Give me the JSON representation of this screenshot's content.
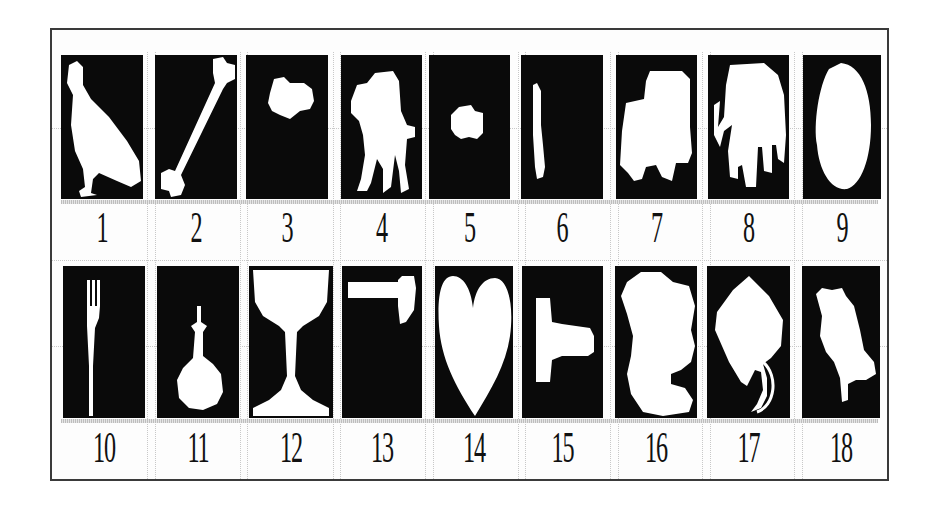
{
  "figure": {
    "rows": [
      {
        "items": [
          {
            "label": "1",
            "shape": "bird-silhouette"
          },
          {
            "label": "2",
            "shape": "bone-silhouette"
          },
          {
            "label": "3",
            "shape": "small-blob-silhouette"
          },
          {
            "label": "4",
            "shape": "camel-silhouette"
          },
          {
            "label": "5",
            "shape": "small-car-silhouette"
          },
          {
            "label": "6",
            "shape": "thin-bar-silhouette"
          },
          {
            "label": "7",
            "shape": "truck-silhouette"
          },
          {
            "label": "8",
            "shape": "elephant-silhouette"
          },
          {
            "label": "9",
            "shape": "oval-silhouette"
          }
        ]
      },
      {
        "items": [
          {
            "label": "10",
            "shape": "fork-silhouette"
          },
          {
            "label": "11",
            "shape": "flask-silhouette"
          },
          {
            "label": "12",
            "shape": "goblet-silhouette"
          },
          {
            "label": "13",
            "shape": "hammer-silhouette"
          },
          {
            "label": "14",
            "shape": "heart-silhouette"
          },
          {
            "label": "15",
            "shape": "key-silhouette"
          },
          {
            "label": "16",
            "shape": "bear-silhouette"
          },
          {
            "label": "17",
            "shape": "kite-silhouette"
          },
          {
            "label": "18",
            "shape": "animal-silhouette"
          }
        ]
      }
    ],
    "colors": {
      "tile_background": "#0a0a0a",
      "shape_fill": "#ffffff",
      "frame_border": "#3a3a3a",
      "grid_line": "#c8c8c8"
    }
  }
}
